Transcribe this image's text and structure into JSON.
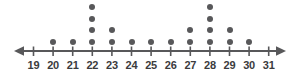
{
  "chart_data": {
    "type": "scatter",
    "plot_style": "dot-plot",
    "title": "",
    "subtitle": "",
    "xlabel": "",
    "ylabel": "",
    "categories": [
      "19",
      "20",
      "21",
      "22",
      "23",
      "24",
      "25",
      "26",
      "27",
      "28",
      "29",
      "30",
      "31"
    ],
    "x": [
      19,
      20,
      21,
      22,
      23,
      24,
      25,
      26,
      27,
      28,
      29,
      30,
      31
    ],
    "values": [
      0,
      1,
      1,
      4,
      2,
      1,
      1,
      1,
      2,
      4,
      2,
      1,
      0
    ],
    "tick_labels": [
      "19",
      "20",
      "21",
      "22",
      "23",
      "24",
      "25",
      "26",
      "27",
      "28",
      "29",
      "30",
      "31"
    ],
    "xlim": [
      19,
      31
    ],
    "ylim": [
      0,
      4
    ],
    "grid": false,
    "legend": null,
    "total_dots": 20,
    "axis_arrows": [
      "left",
      "right"
    ],
    "dot_color": "#58585a",
    "axis_color": "#58585a",
    "label_color": "#3b3b3d",
    "background_color": "#ffffff"
  },
  "axis": {
    "line_label": "number-line",
    "left_arrow_label": "left-arrow",
    "right_arrow_label": "right-arrow"
  }
}
